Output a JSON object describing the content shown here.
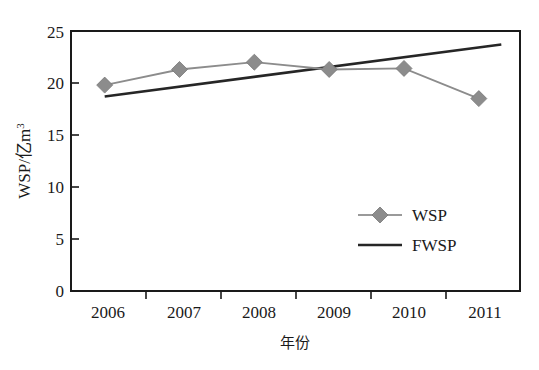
{
  "chart_data": {
    "type": "line",
    "title": "",
    "xlabel": "年份",
    "ylabel": "WSP/亿m³",
    "ylabel_parts": {
      "main": "WSP/亿m",
      "sup": "3"
    },
    "categories": [
      "2006",
      "2007",
      "2008",
      "2009",
      "2010",
      "2011"
    ],
    "x": [
      2006,
      2007,
      2008,
      2009,
      2010,
      2011
    ],
    "xlim": [
      2005.55,
      2011.55
    ],
    "ylim": [
      0,
      25
    ],
    "yticks": [
      "0",
      "5",
      "10",
      "15",
      "20",
      "25"
    ],
    "ytick_values": [
      0,
      5,
      10,
      15,
      20,
      25
    ],
    "grid": false,
    "legend_position": "center-right",
    "series": [
      {
        "name": "WSP",
        "type": "line-markers",
        "marker": "diamond",
        "color": "#8c8c8c",
        "values": [
          19.8,
          21.3,
          22.0,
          21.3,
          21.4,
          18.5
        ]
      },
      {
        "name": "FWSP",
        "type": "trend-line",
        "marker": "none",
        "color": "#262626",
        "x_endpoints": [
          2006.0,
          2011.3
        ],
        "y_endpoints": [
          18.7,
          23.7
        ]
      }
    ],
    "legend_entries": [
      {
        "label": "WSP",
        "color": "#8c8c8c",
        "marker": "diamond"
      },
      {
        "label": "FWSP",
        "color": "#262626",
        "marker": "none"
      }
    ],
    "axis_color": "#1a1a1a",
    "background": "#ffffff"
  }
}
